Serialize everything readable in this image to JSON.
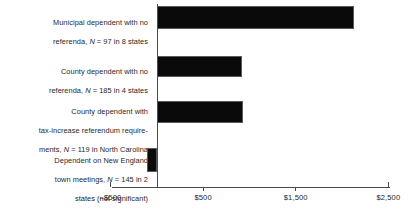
{
  "chart_data": {
    "type": "bar",
    "orientation": "horizontal",
    "title": "",
    "xlabel": "",
    "ylabel": "",
    "xlim": [
      -500,
      2500
    ],
    "grid": false,
    "legend": null,
    "categories": [
      "Municipal dependent with no referenda, N = 97 in 8 states",
      "County dependent with no referenda, N = 185 in 4 states",
      "County dependent with tax-increase referendum require-ments, N = 119 in North Carolina",
      "Dependent on New England town meetings, N = 145 in 2 states (not significant)"
    ],
    "values": [
      2125,
      925,
      935,
      -110
    ],
    "tick_values": [
      -500,
      500,
      1500,
      2500
    ],
    "tick_labels": [
      "–$500",
      "$500",
      "$1,500",
      "$2,500"
    ],
    "bar_color": "#0a0a0a",
    "axis_color": "#4a4a4a",
    "text_color": "#1f1f1f"
  },
  "labels": {
    "cat0": {
      "line1": "Municipal dependent with no",
      "line2_a": "referenda, ",
      "line2_n": "N",
      "line2_b": " = 97 in 8 states"
    },
    "cat1": {
      "line1": "County dependent with no",
      "line2_a": "referenda, ",
      "line2_n": "N",
      "line2_b": " = 185 in 4 states"
    },
    "cat2": {
      "line1": "County dependent with",
      "line2": "tax-increase referendum require-",
      "line3_a": "ments, ",
      "line3_n": "N",
      "line3_b": " = 119 in North Carolina"
    },
    "cat3": {
      "line1": "Dependent on New England",
      "line2_a": "town meetings, ",
      "line2_n": "N",
      "line2_b": " = 145 in 2",
      "line3": "states (not significant)"
    }
  },
  "axis": {
    "tick0": "–$500",
    "tick1": "$500",
    "tick2": "$1,500",
    "tick3": "$2,500"
  }
}
